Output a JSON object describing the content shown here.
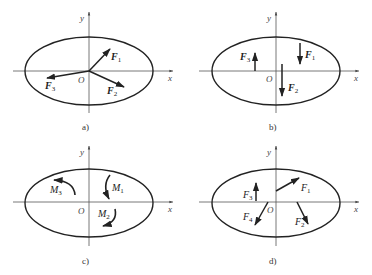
{
  "figure": {
    "panels": [
      {
        "id": "a",
        "caption": "a)",
        "axis_x": "x",
        "axis_y": "y",
        "origin": "O",
        "items": [
          {
            "kind": "force",
            "name": "F",
            "sub": "1"
          },
          {
            "kind": "force",
            "name": "F",
            "sub": "2"
          },
          {
            "kind": "force",
            "name": "F",
            "sub": "3"
          }
        ]
      },
      {
        "id": "b",
        "caption": "b)",
        "axis_x": "x",
        "axis_y": "y",
        "origin": "O",
        "items": [
          {
            "kind": "force",
            "name": "F",
            "sub": "1"
          },
          {
            "kind": "force",
            "name": "F",
            "sub": "2"
          },
          {
            "kind": "force",
            "name": "F",
            "sub": "3"
          }
        ]
      },
      {
        "id": "c",
        "caption": "c)",
        "axis_x": "x",
        "axis_y": "y",
        "origin": "O",
        "items": [
          {
            "kind": "moment",
            "name": "M",
            "sub": "1"
          },
          {
            "kind": "moment",
            "name": "M",
            "sub": "2"
          },
          {
            "kind": "moment",
            "name": "M",
            "sub": "3"
          }
        ]
      },
      {
        "id": "d",
        "caption": "d)",
        "axis_x": "x",
        "axis_y": "y",
        "origin": "O",
        "items": [
          {
            "kind": "force",
            "name": "F",
            "sub": "1"
          },
          {
            "kind": "force",
            "name": "F",
            "sub": "2"
          },
          {
            "kind": "force",
            "name": "F",
            "sub": "3"
          },
          {
            "kind": "force",
            "name": "F",
            "sub": "4"
          }
        ]
      }
    ]
  }
}
